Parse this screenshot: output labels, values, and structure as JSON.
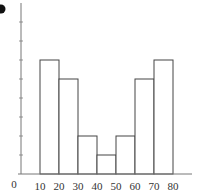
{
  "panel_label": "b",
  "chart_data": {
    "type": "bar",
    "subtype": "histogram",
    "title": "",
    "xlabel": "",
    "ylabel": "",
    "bin_edges": [
      10,
      20,
      30,
      40,
      50,
      60,
      70,
      80
    ],
    "categories": [
      "10-20",
      "20-30",
      "30-40",
      "40-50",
      "50-60",
      "60-70",
      "70-80"
    ],
    "values": [
      6,
      5,
      2,
      1,
      2,
      5,
      6
    ],
    "x_tick_labels": [
      "0",
      "10",
      "20",
      "30",
      "40",
      "50",
      "60",
      "70",
      "80"
    ],
    "y_tick_labels": [],
    "y_ticks": [
      1,
      2,
      3,
      4,
      5,
      6,
      7,
      8
    ],
    "xlim": [
      0,
      90
    ],
    "ylim": [
      0,
      9
    ],
    "grid": false,
    "legend": null,
    "colors": {
      "bar_fill": "#ffffff",
      "bar_stroke": "#444444",
      "axis": "#666666"
    }
  }
}
